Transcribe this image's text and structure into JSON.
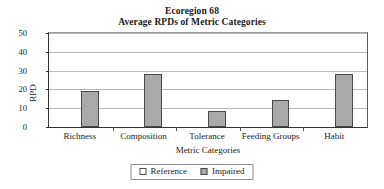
{
  "chart_data": {
    "type": "bar",
    "title": "Ecoregion 68",
    "subtitle": "Average RPDs of Metric Categories",
    "xlabel": "Metric Categories",
    "ylabel": "RPD",
    "categories": [
      "Richness",
      "Composition",
      "Tolerance",
      "Feeding Groups",
      "Habit"
    ],
    "series": [
      {
        "name": "Reference",
        "values": [
          0,
          0,
          0,
          0,
          0
        ],
        "color": "#ffffff"
      },
      {
        "name": "Impaired",
        "values": [
          19.3,
          28.1,
          8.5,
          14.6,
          28.1
        ],
        "color": "#a9a9a9"
      }
    ],
    "ylim": [
      0,
      50
    ],
    "yticks": [
      0,
      10,
      20,
      30,
      40,
      50
    ],
    "ytick_labels": [
      "0",
      "10",
      "20",
      "30",
      "40",
      "50"
    ],
    "grid": true,
    "legend_position": "bottom",
    "legend_entries": [
      "Reference",
      "Impaired"
    ]
  }
}
